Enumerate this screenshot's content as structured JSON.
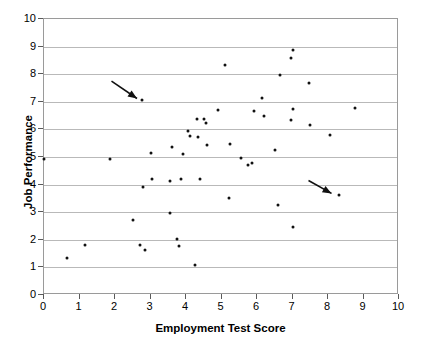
{
  "chart_data": {
    "type": "scatter",
    "title": "",
    "xlabel": "Employment Test Score",
    "ylabel": "Job Performance",
    "xlim": [
      0,
      10
    ],
    "ylim": [
      0,
      10
    ],
    "xticks": [
      0,
      1,
      2,
      3,
      4,
      5,
      6,
      7,
      8,
      9,
      10
    ],
    "yticks": [
      0,
      1,
      2,
      3,
      4,
      5,
      6,
      7,
      8,
      9,
      10
    ],
    "grid": "horizontal",
    "legend": "none",
    "marker": "filled-circle",
    "marker_color": "#111111",
    "points": [
      [
        0.0,
        4.92
      ],
      [
        0.65,
        1.35
      ],
      [
        1.15,
        1.81
      ],
      [
        1.85,
        4.92
      ],
      [
        2.5,
        2.72
      ],
      [
        2.7,
        1.81
      ],
      [
        2.75,
        7.05
      ],
      [
        2.8,
        3.93
      ],
      [
        2.85,
        1.65
      ],
      [
        3.0,
        5.15
      ],
      [
        3.05,
        4.19
      ],
      [
        3.55,
        4.14
      ],
      [
        3.55,
        2.98
      ],
      [
        3.6,
        5.35
      ],
      [
        3.75,
        2.02
      ],
      [
        3.8,
        1.76
      ],
      [
        3.85,
        4.21
      ],
      [
        3.9,
        5.11
      ],
      [
        4.05,
        5.94
      ],
      [
        4.1,
        5.76
      ],
      [
        4.25,
        1.08
      ],
      [
        4.3,
        6.39
      ],
      [
        4.35,
        5.74
      ],
      [
        4.4,
        4.19
      ],
      [
        4.5,
        6.38
      ],
      [
        4.55,
        6.23
      ],
      [
        4.6,
        5.43
      ],
      [
        4.9,
        6.71
      ],
      [
        5.1,
        8.35
      ],
      [
        5.2,
        3.52
      ],
      [
        5.25,
        5.47
      ],
      [
        5.55,
        4.95
      ],
      [
        5.75,
        4.71
      ],
      [
        5.85,
        4.79
      ],
      [
        5.9,
        6.66
      ],
      [
        6.15,
        7.14
      ],
      [
        6.2,
        6.49
      ],
      [
        6.5,
        5.27
      ],
      [
        6.6,
        3.27
      ],
      [
        6.65,
        7.98
      ],
      [
        6.95,
        8.59
      ],
      [
        6.95,
        6.36
      ],
      [
        7.0,
        8.88
      ],
      [
        7.0,
        6.74
      ],
      [
        7.0,
        2.48
      ],
      [
        7.45,
        7.69
      ],
      [
        7.5,
        6.17
      ],
      [
        8.05,
        5.81
      ],
      [
        8.3,
        3.61
      ],
      [
        8.75,
        6.78
      ]
    ],
    "annotations": [
      {
        "name": "arrow-upper-left",
        "type": "arrow",
        "tail": [
          1.9,
          7.75
        ],
        "head": [
          2.62,
          7.12
        ],
        "points_to": [
          2.75,
          7.05
        ]
      },
      {
        "name": "arrow-lower-right",
        "type": "arrow",
        "tail": [
          7.45,
          4.15
        ],
        "head": [
          8.1,
          3.68
        ],
        "points_to": [
          8.3,
          3.61
        ]
      }
    ]
  }
}
